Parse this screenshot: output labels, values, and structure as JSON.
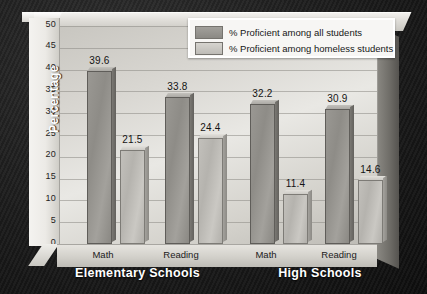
{
  "axis": {
    "y_title": "Percentage",
    "y_ticks": [
      "50",
      "45",
      "40",
      "35",
      "30",
      "25",
      "20",
      "15",
      "10",
      "5",
      "0"
    ]
  },
  "legend": {
    "items": [
      {
        "label": "% Proficient among all students",
        "color": "#8e8c87"
      },
      {
        "label": "% Proficient among homeless students",
        "color": "#c2c0bb"
      }
    ]
  },
  "group_titles": [
    "Elementary Schools",
    "High Schools"
  ],
  "x_labels": [
    "Math",
    "Reading",
    "Math",
    "Reading"
  ],
  "bar_labels": [
    "39.6",
    "21.5",
    "33.8",
    "24.4",
    "32.2",
    "11.4",
    "30.9",
    "14.6"
  ],
  "chart_data": {
    "type": "bar",
    "title": "",
    "xlabel": "",
    "ylabel": "Percentage",
    "ylim": [
      0,
      50
    ],
    "yticks": [
      0,
      5,
      10,
      15,
      20,
      25,
      30,
      35,
      40,
      45,
      50
    ],
    "grid": true,
    "legend_position": "top-right",
    "categories": [
      "Elementary Schools - Math",
      "Elementary Schools - Reading",
      "High Schools - Math",
      "High Schools - Reading"
    ],
    "series": [
      {
        "name": "% Proficient among all students",
        "values": [
          39.6,
          33.8,
          32.2,
          30.9
        ],
        "color": "#8e8c87"
      },
      {
        "name": "% Proficient among homeless students",
        "values": [
          21.5,
          24.4,
          11.4,
          14.6
        ],
        "color": "#c2c0bb"
      }
    ]
  }
}
